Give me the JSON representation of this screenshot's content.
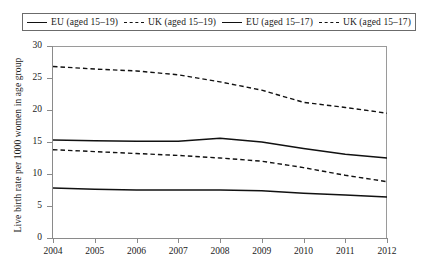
{
  "chart_data": {
    "type": "line",
    "title": "",
    "xlabel": "",
    "ylabel": "Live birth rate per 1000 women in age group",
    "x": [
      2004,
      2005,
      2006,
      2007,
      2008,
      2009,
      2010,
      2011,
      2012
    ],
    "xticklabels": [
      "2004",
      "2005",
      "2006",
      "2007",
      "2008",
      "2009",
      "2010",
      "2011",
      "2012"
    ],
    "yticklabels": [
      "0",
      "5",
      "10",
      "15",
      "20",
      "25",
      "30"
    ],
    "yticks": [
      0,
      5,
      10,
      15,
      20,
      25,
      30
    ],
    "ylim": [
      0,
      30
    ],
    "xlim": [
      2004,
      2012
    ],
    "grid": false,
    "legend_position": "top",
    "series": [
      {
        "name": "EU (aged 15–19)",
        "style": "solid",
        "color": "#111111",
        "values": [
          15.3,
          15.2,
          15.1,
          15.1,
          15.6,
          15.0,
          14.0,
          13.1,
          12.5
        ]
      },
      {
        "name": "UK (aged 15–19)",
        "style": "dashed",
        "color": "#111111",
        "values": [
          26.8,
          26.4,
          26.1,
          25.5,
          24.4,
          23.1,
          21.2,
          20.4,
          19.5
        ]
      },
      {
        "name": "EU (aged 15–17)",
        "style": "solid",
        "color": "#111111",
        "values": [
          7.8,
          7.6,
          7.5,
          7.5,
          7.5,
          7.4,
          7.0,
          6.7,
          6.4
        ]
      },
      {
        "name": "UK (aged 15–17)",
        "style": "dashed",
        "color": "#111111",
        "values": [
          13.8,
          13.5,
          13.2,
          12.9,
          12.5,
          12.0,
          11.0,
          9.8,
          8.8
        ]
      }
    ]
  },
  "legend": {
    "entries": [
      {
        "label": "EU (aged 15–19)",
        "style": "solid"
      },
      {
        "label": "UK (aged 15–19)",
        "style": "dashed"
      },
      {
        "label": "EU (aged 15–17)",
        "style": "solid"
      },
      {
        "label": "UK (aged 15–17)",
        "style": "dashed"
      }
    ]
  }
}
